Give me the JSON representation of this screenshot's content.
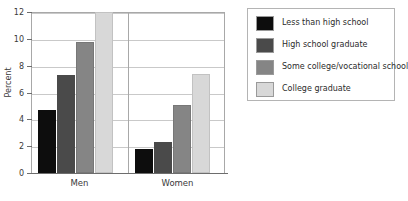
{
  "chart_data": {
    "type": "bar",
    "title": "",
    "xlabel": "",
    "ylabel": "Percent",
    "ylim": [
      0,
      12
    ],
    "yticks": [
      0,
      2,
      4,
      6,
      8,
      10,
      12
    ],
    "grid": true,
    "legend_position": "right",
    "categories": [
      "Men",
      "Women"
    ],
    "series": [
      {
        "name": "Less than high school",
        "color": "#0d0d0d",
        "values": [
          4.7,
          1.8
        ]
      },
      {
        "name": "High school graduate",
        "color": "#4a4a4a",
        "values": [
          7.3,
          2.3
        ]
      },
      {
        "name": "Some college/vocational school",
        "color": "#858585",
        "values": [
          9.8,
          5.1
        ]
      },
      {
        "name": "College graduate",
        "color": "#d8d8d8",
        "values": [
          12.0,
          7.35
        ]
      }
    ]
  },
  "axis": {
    "y_title": "Percent",
    "y_tick_labels": [
      "0",
      "2",
      "4",
      "6",
      "8",
      "10",
      "12"
    ],
    "x_tick_labels": [
      "Men",
      "Women"
    ]
  },
  "legend": {
    "entries": [
      {
        "label": "Less than high school",
        "color": "#0d0d0d"
      },
      {
        "label": "High school graduate",
        "color": "#4a4a4a"
      },
      {
        "label": "Some college/vocational school",
        "color": "#858585"
      },
      {
        "label": "College graduate",
        "color": "#d8d8d8"
      }
    ]
  }
}
